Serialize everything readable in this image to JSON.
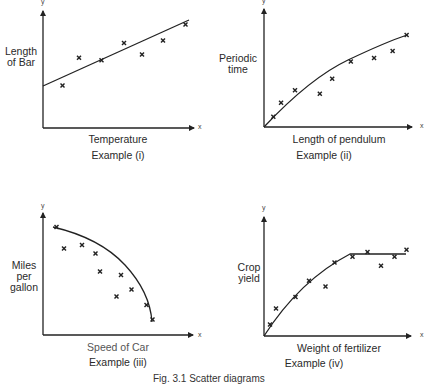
{
  "figure": {
    "caption": "Fig. 3.1 Scatter diagrams"
  },
  "chart_data": [
    {
      "type": "scatter",
      "title": "Example (i)",
      "xlabel": "Temperature",
      "ylabel": "Length of Bar",
      "axis_letters": {
        "x": "x",
        "y": "y"
      },
      "fit": "linear",
      "grid": false,
      "points": [
        [
          0.13,
          0.37
        ],
        [
          0.24,
          0.61
        ],
        [
          0.39,
          0.59
        ],
        [
          0.54,
          0.74
        ],
        [
          0.66,
          0.64
        ],
        [
          0.8,
          0.76
        ],
        [
          0.95,
          0.9
        ]
      ],
      "fit_line": [
        [
          0.0,
          0.36
        ],
        [
          0.98,
          0.92
        ]
      ],
      "xlim": [
        0,
        1
      ],
      "ylim": [
        0,
        1
      ]
    },
    {
      "type": "scatter",
      "title": "Example (ii)",
      "xlabel": "Length of pendulum",
      "ylabel": "Periodic time",
      "axis_letters": {
        "x": "x",
        "y": "y"
      },
      "fit": "curve (concave, increasing, through origin)",
      "grid": false,
      "points": [
        [
          0.06,
          0.09
        ],
        [
          0.11,
          0.21
        ],
        [
          0.2,
          0.32
        ],
        [
          0.36,
          0.29
        ],
        [
          0.44,
          0.42
        ],
        [
          0.56,
          0.57
        ],
        [
          0.71,
          0.6
        ],
        [
          0.83,
          0.66
        ],
        [
          0.92,
          0.8
        ]
      ],
      "fit_line": [
        [
          0.0,
          0.0
        ],
        [
          0.25,
          0.3
        ],
        [
          0.5,
          0.53
        ],
        [
          0.75,
          0.68
        ],
        [
          0.95,
          0.78
        ]
      ],
      "xlim": [
        0,
        1
      ],
      "ylim": [
        0,
        1
      ]
    },
    {
      "type": "scatter",
      "title": "Example (iii)",
      "xlabel": "Speed of Car",
      "ylabel": "Miles per gallon",
      "axis_letters": {
        "x": "x",
        "y": "y"
      },
      "fit": "curve (concave, decreasing)",
      "grid": false,
      "points": [
        [
          0.09,
          0.9
        ],
        [
          0.14,
          0.72
        ],
        [
          0.26,
          0.75
        ],
        [
          0.35,
          0.68
        ],
        [
          0.38,
          0.53
        ],
        [
          0.52,
          0.5
        ],
        [
          0.49,
          0.32
        ],
        [
          0.59,
          0.38
        ],
        [
          0.69,
          0.25
        ],
        [
          0.73,
          0.13
        ]
      ],
      "fit_line": [
        [
          0.07,
          0.88
        ],
        [
          0.3,
          0.77
        ],
        [
          0.5,
          0.58
        ],
        [
          0.65,
          0.36
        ],
        [
          0.74,
          0.1
        ]
      ],
      "xlim": [
        0,
        1
      ],
      "ylim": [
        0,
        1
      ]
    },
    {
      "type": "scatter",
      "title": "Example (iv)",
      "xlabel": "Weight of fertilizer",
      "ylabel": "Crop yield",
      "axis_letters": {
        "x": "x",
        "y": "y"
      },
      "fit": "rising curve then plateau",
      "grid": false,
      "points": [
        [
          0.04,
          0.1
        ],
        [
          0.08,
          0.24
        ],
        [
          0.21,
          0.34
        ],
        [
          0.3,
          0.48
        ],
        [
          0.41,
          0.43
        ],
        [
          0.47,
          0.64
        ],
        [
          0.59,
          0.69
        ],
        [
          0.69,
          0.73
        ],
        [
          0.78,
          0.61
        ],
        [
          0.87,
          0.69
        ],
        [
          0.95,
          0.75
        ]
      ],
      "fit_line": [
        [
          0.0,
          0.0
        ],
        [
          0.2,
          0.34
        ],
        [
          0.4,
          0.56
        ],
        [
          0.59,
          0.69
        ],
        [
          0.97,
          0.69
        ]
      ],
      "xlim": [
        0,
        1
      ],
      "ylim": [
        0,
        1
      ]
    }
  ]
}
